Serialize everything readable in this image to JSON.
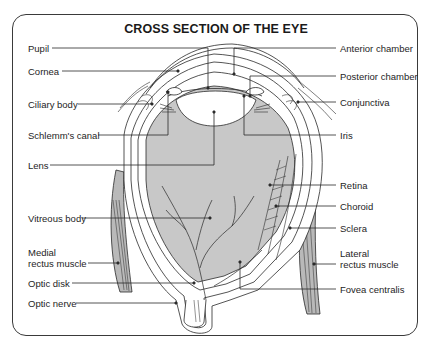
{
  "title": "CROSS SECTION OF THE EYE",
  "colors": {
    "line": "#2a2a2a",
    "vitreous_fill": "#c8c8c8",
    "background": "#ffffff"
  },
  "labels_left": [
    {
      "id": "pupil",
      "text": "Pupil"
    },
    {
      "id": "cornea",
      "text": "Cornea"
    },
    {
      "id": "ciliary-body",
      "text": "Ciliary body"
    },
    {
      "id": "schlemms-canal",
      "text": "Schlemm's canal"
    },
    {
      "id": "lens",
      "text": "Lens"
    },
    {
      "id": "vitreous-body",
      "text": "Vitreous body"
    },
    {
      "id": "medial-rectus-muscle",
      "line1": "Medial",
      "line2": "rectus muscle"
    },
    {
      "id": "optic-disk",
      "text": "Optic disk"
    },
    {
      "id": "optic-nerve",
      "text": "Optic nerve"
    }
  ],
  "labels_right": [
    {
      "id": "anterior-chamber",
      "text": "Anterior chamber"
    },
    {
      "id": "posterior-chamber",
      "text": "Posterior chamber"
    },
    {
      "id": "conjunctiva",
      "text": "Conjunctiva"
    },
    {
      "id": "iris",
      "text": "Iris"
    },
    {
      "id": "retina",
      "text": "Retina"
    },
    {
      "id": "choroid",
      "text": "Choroid"
    },
    {
      "id": "sclera",
      "text": "Sclera"
    },
    {
      "id": "lateral-rectus-muscle",
      "line1": "Lateral",
      "line2": "rectus muscle"
    },
    {
      "id": "fovea-centralis",
      "text": "Fovea centralis"
    }
  ]
}
